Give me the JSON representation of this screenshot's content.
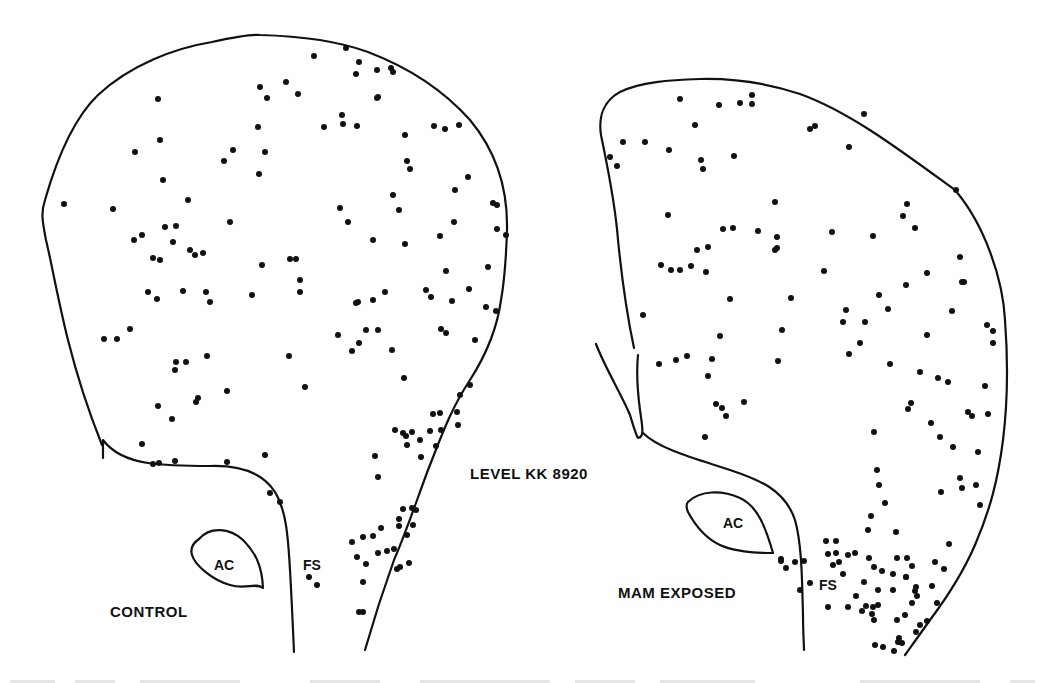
{
  "figure": {
    "level_label": "LEVEL KK 8920",
    "caption_visible": false
  },
  "panels": [
    {
      "id": "control",
      "group_label": "CONTROL",
      "structure_labels": {
        "ac": "AC",
        "fs": "FS"
      },
      "dots": [
        [
          64,
          204
        ],
        [
          158,
          99
        ],
        [
          134,
          240
        ],
        [
          142,
          235
        ],
        [
          165,
          227
        ],
        [
          176,
          226
        ],
        [
          153,
          258
        ],
        [
          160,
          260
        ],
        [
          195,
          255
        ],
        [
          203,
          253
        ],
        [
          190,
          250
        ],
        [
          173,
          242
        ],
        [
          113,
          209
        ],
        [
          135,
          152
        ],
        [
          160,
          140
        ],
        [
          163,
          180
        ],
        [
          188,
          200
        ],
        [
          224,
          161
        ],
        [
          233,
          150
        ],
        [
          260,
          87
        ],
        [
          267,
          98
        ],
        [
          286,
          82
        ],
        [
          298,
          94
        ],
        [
          258,
          127
        ],
        [
          265,
          152
        ],
        [
          259,
          174
        ],
        [
          230,
          222
        ],
        [
          262,
          265
        ],
        [
          290,
          259
        ],
        [
          296,
          259
        ],
        [
          300,
          280
        ],
        [
          300,
          292
        ],
        [
          252,
          295
        ],
        [
          210,
          302
        ],
        [
          206,
          292
        ],
        [
          183,
          291
        ],
        [
          148,
          292
        ],
        [
          157,
          299
        ],
        [
          104,
          339
        ],
        [
          117,
          339
        ],
        [
          130,
          329
        ],
        [
          175,
          370
        ],
        [
          176,
          362
        ],
        [
          186,
          362
        ],
        [
          207,
          356
        ],
        [
          227,
          391
        ],
        [
          196,
          402
        ],
        [
          198,
          398
        ],
        [
          158,
          406
        ],
        [
          172,
          419
        ],
        [
          305,
          387
        ],
        [
          289,
          356
        ],
        [
          338,
          335
        ],
        [
          342,
          115
        ],
        [
          314,
          56
        ],
        [
          346,
          48
        ],
        [
          359,
          62
        ],
        [
          356,
          74
        ],
        [
          377,
          70
        ],
        [
          391,
          68
        ],
        [
          393,
          72
        ],
        [
          324,
          127
        ],
        [
          343,
          124
        ],
        [
          357,
          126
        ],
        [
          378,
          97
        ],
        [
          405,
          135
        ],
        [
          377,
          98
        ],
        [
          407,
          161
        ],
        [
          410,
          169
        ],
        [
          434,
          126
        ],
        [
          445,
          129
        ],
        [
          459,
          125
        ],
        [
          340,
          208
        ],
        [
          348,
          222
        ],
        [
          356,
          303
        ],
        [
          358,
          302
        ],
        [
          373,
          300
        ],
        [
          385,
          292
        ],
        [
          393,
          195
        ],
        [
          399,
          210
        ],
        [
          455,
          190
        ],
        [
          440,
          236
        ],
        [
          446,
          271
        ],
        [
          431,
          297
        ],
        [
          426,
          290
        ],
        [
          454,
          222
        ],
        [
          468,
          177
        ],
        [
          493,
          203
        ],
        [
          497,
          205
        ],
        [
          469,
          289
        ],
        [
          486,
          307
        ],
        [
          496,
          311
        ],
        [
          506,
          235
        ],
        [
          497,
          229
        ],
        [
          488,
          267
        ],
        [
          452,
          301
        ],
        [
          405,
          244
        ],
        [
          373,
          240
        ],
        [
          392,
          350
        ],
        [
          352,
          351
        ],
        [
          359,
          343
        ],
        [
          366,
          330
        ],
        [
          378,
          330
        ],
        [
          404,
          378
        ],
        [
          395,
          430
        ],
        [
          433,
          414
        ],
        [
          440,
          413
        ],
        [
          460,
          395
        ],
        [
          457,
          412
        ],
        [
          475,
          340
        ],
        [
          470,
          385
        ],
        [
          446,
          333
        ],
        [
          441,
          329
        ],
        [
          142,
          444
        ],
        [
          153,
          464
        ],
        [
          175,
          461
        ],
        [
          227,
          462
        ],
        [
          265,
          455
        ],
        [
          270,
          493
        ],
        [
          280,
          502
        ],
        [
          403,
          433
        ],
        [
          406,
          436
        ],
        [
          412,
          432
        ],
        [
          407,
          445
        ],
        [
          420,
          440
        ],
        [
          436,
          446
        ],
        [
          430,
          431
        ],
        [
          375,
          456
        ],
        [
          378,
          477
        ],
        [
          421,
          457
        ],
        [
          458,
          425
        ],
        [
          441,
          430
        ],
        [
          373,
          536
        ],
        [
          381,
          528
        ],
        [
          399,
          519
        ],
        [
          403,
          509
        ],
        [
          412,
          508
        ],
        [
          413,
          525
        ],
        [
          399,
          526
        ],
        [
          407,
          535
        ],
        [
          416,
          510
        ],
        [
          363,
          537
        ],
        [
          352,
          542
        ],
        [
          387,
          551
        ],
        [
          357,
          557
        ],
        [
          366,
          564
        ],
        [
          378,
          553
        ],
        [
          394,
          549
        ],
        [
          397,
          569
        ],
        [
          400,
          567
        ],
        [
          409,
          563
        ],
        [
          363,
          582
        ],
        [
          309,
          577
        ],
        [
          317,
          585
        ],
        [
          359,
          612
        ],
        [
          363,
          612
        ],
        [
          159,
          463
        ]
      ]
    },
    {
      "id": "mam-exposed",
      "group_label": "MAM EXPOSED",
      "structure_labels": {
        "ac": "AC",
        "fs": "FS"
      },
      "dots": [
        [
          680,
          99
        ],
        [
          719,
          105
        ],
        [
          740,
          103
        ],
        [
          752,
          95
        ],
        [
          752,
          104
        ],
        [
          864,
          114
        ],
        [
          810,
          129
        ],
        [
          815,
          126
        ],
        [
          849,
          147
        ],
        [
          695,
          125
        ],
        [
          610,
          157
        ],
        [
          617,
          166
        ],
        [
          623,
          142
        ],
        [
          645,
          142
        ],
        [
          669,
          150
        ],
        [
          701,
          160
        ],
        [
          734,
          156
        ],
        [
          703,
          169
        ],
        [
          775,
          202
        ],
        [
          956,
          190
        ],
        [
          907,
          204
        ],
        [
          903,
          216
        ],
        [
          915,
          228
        ],
        [
          668,
          215
        ],
        [
          723,
          229
        ],
        [
          733,
          228
        ],
        [
          708,
          247
        ],
        [
          697,
          250
        ],
        [
          758,
          231
        ],
        [
          777,
          237
        ],
        [
          775,
          250
        ],
        [
          777,
          248
        ],
        [
          832,
          232
        ],
        [
          873,
          236
        ],
        [
          661,
          265
        ],
        [
          671,
          270
        ],
        [
          680,
          270
        ],
        [
          691,
          266
        ],
        [
          706,
          272
        ],
        [
          730,
          299
        ],
        [
          791,
          298
        ],
        [
          824,
          271
        ],
        [
          879,
          295
        ],
        [
          927,
          273
        ],
        [
          960,
          257
        ],
        [
          964,
          282
        ],
        [
          906,
          285
        ],
        [
          888,
          309
        ],
        [
          846,
          310
        ],
        [
          843,
          322
        ],
        [
          865,
          322
        ],
        [
          952,
          311
        ],
        [
          962,
          282
        ],
        [
          643,
          315
        ],
        [
          659,
          364
        ],
        [
          676,
          360
        ],
        [
          720,
          336
        ],
        [
          782,
          330
        ],
        [
          860,
          343
        ],
        [
          849,
          354
        ],
        [
          890,
          364
        ],
        [
          687,
          356
        ],
        [
          712,
          359
        ],
        [
          708,
          376
        ],
        [
          716,
          404
        ],
        [
          722,
          408
        ],
        [
          726,
          416
        ],
        [
          744,
          402
        ],
        [
          705,
          437
        ],
        [
          778,
          361
        ],
        [
          927,
          335
        ],
        [
          920,
          372
        ],
        [
          938,
          378
        ],
        [
          948,
          382
        ],
        [
          987,
          325
        ],
        [
          993,
          331
        ],
        [
          993,
          343
        ],
        [
          972,
          416
        ],
        [
          988,
          414
        ],
        [
          985,
          386
        ],
        [
          968,
          412
        ],
        [
          931,
          423
        ],
        [
          908,
          409
        ],
        [
          911,
          403
        ],
        [
          874,
          432
        ],
        [
          877,
          470
        ],
        [
          879,
          485
        ],
        [
          885,
          503
        ],
        [
          871,
          516
        ],
        [
          940,
          437
        ],
        [
          953,
          447
        ],
        [
          960,
          478
        ],
        [
          962,
          488
        ],
        [
          941,
          492
        ],
        [
          980,
          505
        ],
        [
          976,
          485
        ],
        [
          896,
          532
        ],
        [
          868,
          530
        ],
        [
          907,
          558
        ],
        [
          912,
          566
        ],
        [
          906,
          577
        ],
        [
          949,
          544
        ],
        [
          944,
          569
        ],
        [
          915,
          591
        ],
        [
          897,
          620
        ],
        [
          897,
          558
        ],
        [
          935,
          562
        ],
        [
          932,
          586
        ],
        [
          937,
          603
        ],
        [
          978,
          452
        ],
        [
          826,
          541
        ],
        [
          836,
          541
        ],
        [
          836,
          553
        ],
        [
          848,
          555
        ],
        [
          828,
          554
        ],
        [
          833,
          565
        ],
        [
          839,
          562
        ],
        [
          843,
          574
        ],
        [
          855,
          553
        ],
        [
          869,
          558
        ],
        [
          874,
          567
        ],
        [
          882,
          571
        ],
        [
          864,
          582
        ],
        [
          878,
          590
        ],
        [
          893,
          574
        ],
        [
          893,
          590
        ],
        [
          906,
          577
        ],
        [
          916,
          587
        ],
        [
          917,
          596
        ],
        [
          912,
          603
        ],
        [
          905,
          615
        ],
        [
          920,
          625
        ],
        [
          916,
          632
        ],
        [
          927,
          621
        ],
        [
          828,
          607
        ],
        [
          848,
          607
        ],
        [
          866,
          606
        ],
        [
          862,
          611
        ],
        [
          873,
          607
        ],
        [
          874,
          620
        ],
        [
          875,
          645
        ],
        [
          883,
          647
        ],
        [
          898,
          642
        ],
        [
          894,
          651
        ],
        [
          902,
          643
        ],
        [
          899,
          638
        ],
        [
          810,
          583
        ],
        [
          800,
          590
        ],
        [
          781,
          561
        ],
        [
          786,
          568
        ],
        [
          795,
          562
        ],
        [
          804,
          561
        ],
        [
          781,
          559
        ],
        [
          856,
          596
        ],
        [
          878,
          605
        ],
        [
          872,
          614
        ]
      ]
    }
  ]
}
